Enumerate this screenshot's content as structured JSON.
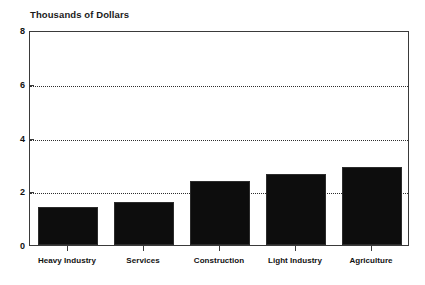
{
  "chart_data": {
    "type": "bar",
    "title": "Thousands of Dollars",
    "subtitle": "",
    "xlabel": "",
    "ylabel": "",
    "categories": [
      "Heavy Industry",
      "Services",
      "Construction",
      "Light Industry",
      "Agriculture"
    ],
    "values": [
      1.4,
      1.6,
      2.4,
      2.65,
      2.9
    ],
    "ylim": [
      0,
      8
    ],
    "yticks": [
      0,
      2,
      4,
      6,
      8
    ],
    "ytick_labels": [
      "0",
      "2",
      "4",
      "6",
      "8"
    ],
    "gridlines_at": [
      2,
      4,
      6
    ],
    "grid": true,
    "grid_style": "dotted",
    "legend": false,
    "legend_position": "none",
    "series": [
      {
        "name": "Value",
        "values": [
          1.4,
          1.6,
          2.4,
          2.65,
          2.9
        ]
      }
    ],
    "bar_color": "#0d0d0d",
    "axis_color": "#3a3a3a",
    "grid_color": "#2e2e2e",
    "background": "#ffffff"
  }
}
